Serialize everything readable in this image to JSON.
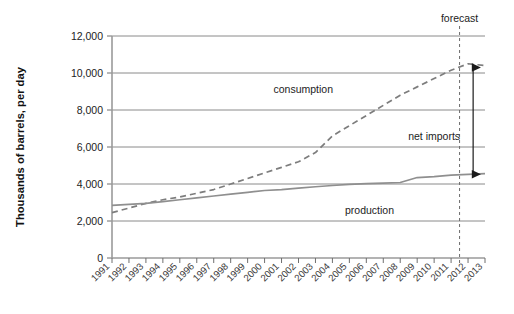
{
  "chart_data": {
    "type": "line",
    "title": "",
    "subtitle": "",
    "xlabel": "",
    "ylabel": "Thousands of barrels, per day",
    "xlim": [
      1991,
      2013
    ],
    "ylim": [
      0,
      12000
    ],
    "grid": true,
    "legend_position": "inline-labels",
    "yticks": [
      0,
      2000,
      4000,
      6000,
      8000,
      10000,
      12000
    ],
    "ytick_labels": [
      "0",
      "2,000",
      "4,000",
      "6,000",
      "8,000",
      "10,000",
      "12,000"
    ],
    "x": [
      1991,
      1992,
      1993,
      1994,
      1995,
      1996,
      1997,
      1998,
      1999,
      2000,
      2001,
      2002,
      2003,
      2004,
      2005,
      2006,
      2007,
      2008,
      2009,
      2010,
      2011,
      2012,
      2013
    ],
    "xtick_labels": [
      "1991",
      "1992",
      "1993",
      "1994",
      "1995",
      "1996",
      "1997",
      "1998",
      "1999",
      "2000",
      "2001",
      "2002",
      "2003",
      "2004",
      "2005",
      "2006",
      "2007",
      "2008",
      "2009",
      "2010",
      "2011",
      "2012",
      "2013"
    ],
    "series": [
      {
        "name": "consumption",
        "style": "dashed",
        "color": "#7d7d7d",
        "label": "consumption",
        "values": [
          2450,
          2700,
          2950,
          3150,
          3300,
          3500,
          3700,
          4000,
          4300,
          4600,
          4900,
          5200,
          5700,
          6600,
          7150,
          7700,
          8250,
          8800,
          9250,
          9700,
          10150,
          10500,
          10400
        ]
      },
      {
        "name": "production",
        "style": "solid",
        "color": "#8f8f8f",
        "label": "production",
        "values": [
          2850,
          2900,
          2950,
          3050,
          3150,
          3250,
          3350,
          3450,
          3550,
          3650,
          3700,
          3780,
          3850,
          3920,
          3980,
          4020,
          4050,
          4080,
          4350,
          4400,
          4480,
          4520,
          4560
        ]
      }
    ],
    "annotations": [
      {
        "name": "forecast",
        "label": "forecast",
        "type": "vertical-dashed-line",
        "x": 2011.5
      },
      {
        "name": "net-imports",
        "label": "net imports",
        "type": "double-arrow",
        "x": 2012.3,
        "y_top": 10300,
        "y_bottom": 4530
      }
    ]
  }
}
